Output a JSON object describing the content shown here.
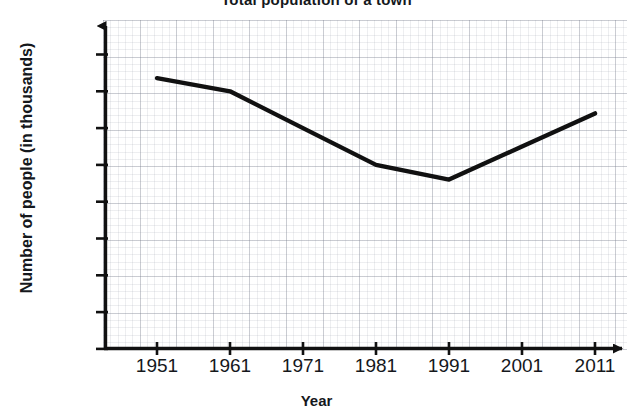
{
  "chart_data": {
    "type": "line",
    "title": "Total population of a town",
    "xlabel": "Year",
    "ylabel": "Number of people (in thousands)",
    "x": [
      1951,
      1961,
      1971,
      1981,
      1991,
      2001,
      2011
    ],
    "categories": [
      "1951",
      "1961",
      "1971",
      "1981",
      "1991",
      "2001",
      "2011"
    ],
    "values": [
      3680,
      3500,
      3000,
      2500,
      2300,
      2750,
      3200
    ],
    "series": [
      {
        "name": "Population",
        "values": [
          3680,
          3500,
          3000,
          2500,
          2300,
          2750,
          3200
        ]
      }
    ],
    "yticks": [
      0,
      500,
      1000,
      1500,
      2000,
      2500,
      3000,
      3500,
      4000
    ],
    "ytick_labels": [
      "0",
      "500",
      "1000",
      "1500",
      "2000",
      "2500",
      "3000",
      "3500",
      "4000"
    ],
    "xlim": [
      1946,
      2016
    ],
    "ylim": [
      0,
      4200
    ],
    "grid": true,
    "legend": "none",
    "line_color": "#111111",
    "grid_color": "#9aa0ad",
    "axis_color": "#111111"
  }
}
